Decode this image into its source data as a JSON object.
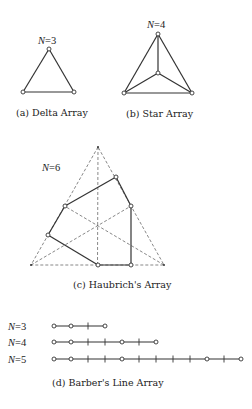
{
  "figure": {
    "panels": [
      {
        "id": "a",
        "caption": "(a) Delta Array",
        "n_label_var": "N",
        "n_label_val": "=3",
        "nodes": [
          [
            49,
            49
          ],
          [
            23,
            92
          ],
          [
            74,
            92
          ]
        ],
        "edges": [
          [
            0,
            1
          ],
          [
            1,
            2
          ],
          [
            2,
            0
          ]
        ]
      },
      {
        "id": "b",
        "caption": "(b) Star Array",
        "n_label_var": "N",
        "n_label_val": "=4",
        "nodes": [
          [
            158,
            34
          ],
          [
            124,
            93
          ],
          [
            192,
            93
          ],
          [
            158,
            73
          ]
        ],
        "edges": [
          [
            0,
            1
          ],
          [
            1,
            2
          ],
          [
            2,
            0
          ],
          [
            3,
            0
          ],
          [
            3,
            1
          ],
          [
            3,
            2
          ]
        ]
      },
      {
        "id": "c",
        "caption": "(c) Haubrich's Array",
        "n_label_var": "N",
        "n_label_val": "=6",
        "outer_triangle": [
          [
            98,
            147
          ],
          [
            31,
            265
          ],
          [
            164,
            265
          ]
        ],
        "center": [
          98,
          226
        ],
        "nodes": [
          [
            116,
            177
          ],
          [
            131,
            206
          ],
          [
            131,
            265
          ],
          [
            98,
            265
          ],
          [
            48,
            235
          ],
          [
            65,
            206
          ]
        ],
        "edges": [
          [
            0,
            1
          ],
          [
            1,
            2
          ],
          [
            2,
            3
          ],
          [
            3,
            4
          ],
          [
            4,
            5
          ],
          [
            5,
            0
          ]
        ]
      },
      {
        "id": "d",
        "caption": "(d) Barber's Line Array",
        "origin_x": 54,
        "unit": 17,
        "rows": [
          {
            "n_label_var": "N",
            "n_label_val": "=3",
            "y": 326,
            "length": 3,
            "elements": [
              0,
              1,
              3
            ]
          },
          {
            "n_label_var": "N",
            "n_label_val": "=4",
            "y": 342,
            "length": 6,
            "elements": [
              0,
              1,
              4,
              6
            ]
          },
          {
            "n_label_var": "N",
            "n_label_val": "=5",
            "y": 359,
            "length": 11,
            "elements": [
              0,
              1,
              4,
              9,
              11
            ]
          }
        ]
      }
    ]
  }
}
